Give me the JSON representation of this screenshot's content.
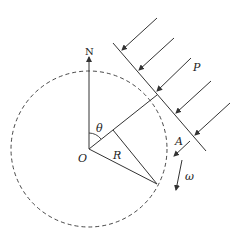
{
  "diagram": {
    "labels": {
      "north": "N",
      "origin": "O",
      "angle": "θ",
      "radius": "R",
      "beam": "P",
      "point": "A",
      "angular_velocity": "ω"
    },
    "colors": {
      "stroke": "#333333",
      "background": "#ffffff"
    }
  }
}
